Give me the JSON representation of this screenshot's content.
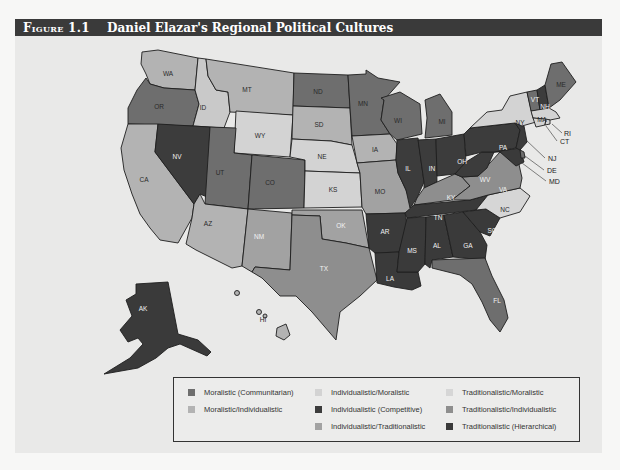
{
  "figure": {
    "number_prefix": "Figure",
    "number": "1.1",
    "title": "Daniel Elazar's Regional Political Cultures"
  },
  "colors": {
    "moralistic": "#6e6e6e",
    "moralistic_individualistic": "#b3b3b3",
    "individualistic_moralistic": "#d3d3d3",
    "individualistic": "#3c3c3c",
    "individualistic_traditionalistic": "#a2a2a2",
    "traditionalistic_moralistic": "#d6d6d6",
    "traditionalistic_individualistic": "#8e8e8e",
    "traditionalistic": "#3a3a3a",
    "panel_background": "#e9e9e8",
    "header_background": "#3a3a3a"
  },
  "legend": {
    "items": [
      {
        "label": "Moralistic (Communitarian)",
        "color": "#6e6e6e"
      },
      {
        "label": "Moralistic/Individualistic",
        "color": "#b3b3b3"
      },
      {
        "label": "Individualistic/Moralistic",
        "color": "#d3d3d3"
      },
      {
        "label": "Individualistic (Competitive)",
        "color": "#3c3c3c"
      },
      {
        "label": "Individualistic/Traditionalistic",
        "color": "#a2a2a2"
      },
      {
        "label": "Traditionalistic/Moralistic",
        "color": "#d6d6d6"
      },
      {
        "label": "Traditionalistic/Individualistic",
        "color": "#8e8e8e"
      },
      {
        "label": "Traditionalistic (Hierarchical)",
        "color": "#3a3a3a"
      }
    ]
  },
  "states": {
    "WA": "WA",
    "OR": "OR",
    "CA": "CA",
    "ID": "ID",
    "NV": "NV",
    "MT": "MT",
    "WY": "WY",
    "UT": "UT",
    "AZ": "AZ",
    "CO": "CO",
    "NM": "NM",
    "ND": "ND",
    "SD": "SD",
    "NE": "NE",
    "KS": "KS",
    "OK": "OK",
    "TX": "TX",
    "MN": "MN",
    "IA": "IA",
    "MO": "MO",
    "AR": "AR",
    "LA": "LA",
    "WI": "WI",
    "IL": "IL",
    "MI": "MI",
    "IN": "IN",
    "OH": "OH",
    "KY": "KY",
    "TN": "TN",
    "MS": "MS",
    "AL": "AL",
    "GA": "GA",
    "FL": "FL",
    "SC": "SC",
    "NC": "NC",
    "VA": "VA",
    "WV": "WV",
    "PA": "PA",
    "NY": "NY",
    "VT": "VT",
    "NH": "NH",
    "ME": "ME",
    "MA": "MA",
    "RI": "RI",
    "CT": "CT",
    "NJ": "NJ",
    "DE": "DE",
    "MD": "MD",
    "AK": "AK",
    "HI": "HI"
  }
}
